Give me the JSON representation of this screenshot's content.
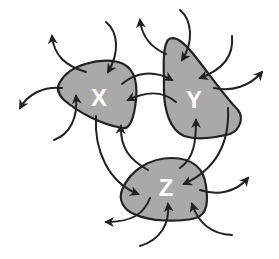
{
  "diagram": {
    "type": "interacting-systems",
    "colors": {
      "node_fill": "#a9a9a9",
      "stroke": "#222222",
      "label": "#ffffff",
      "background": "#ffffff"
    },
    "nodes": [
      {
        "id": "X",
        "label": "X"
      },
      {
        "id": "Y",
        "label": "Y"
      },
      {
        "id": "Z",
        "label": "Z"
      }
    ],
    "edges": [
      {
        "from": "X",
        "to": "Y"
      },
      {
        "from": "Y",
        "to": "X"
      },
      {
        "from": "X",
        "to": "Z"
      },
      {
        "from": "Z",
        "to": "X"
      },
      {
        "from": "Y",
        "to": "Z"
      },
      {
        "from": "Z",
        "to": "Y"
      }
    ],
    "external_arrows": {
      "X": {
        "inbound": 2,
        "outbound": 2
      },
      "Y": {
        "inbound": 2,
        "outbound": 2
      },
      "Z": {
        "inbound": 2,
        "outbound": 2
      }
    }
  }
}
